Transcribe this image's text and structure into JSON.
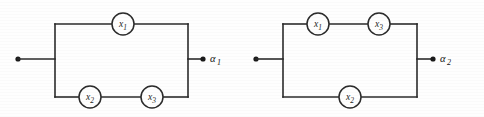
{
  "figure": {
    "background_color": "#fefefe",
    "line_color": "#2b2b2b",
    "width": 484,
    "height": 117
  },
  "circuits": [
    {
      "id": "circuit-1",
      "output_label": "α",
      "output_subscript": "1",
      "input_terminal": {
        "x": 18,
        "y": 59
      },
      "output_terminal": {
        "x": 203,
        "y": 59
      },
      "left_rail_x": 55,
      "right_rail_x": 188,
      "top_rail_y": 24,
      "bottom_rail_y": 97,
      "center_y": 59,
      "top_branch": [
        {
          "name": "x",
          "subscript": "1",
          "cx": 123,
          "cy": 24,
          "r": 11
        }
      ],
      "bottom_branch": [
        {
          "name": "x",
          "subscript": "2",
          "cx": 90,
          "cy": 97,
          "r": 11
        },
        {
          "name": "x",
          "subscript": "3",
          "cx": 152,
          "cy": 97,
          "r": 11
        }
      ]
    },
    {
      "id": "circuit-2",
      "output_label": "α",
      "output_subscript": "2",
      "input_terminal": {
        "x": 256,
        "y": 59
      },
      "output_terminal": {
        "x": 433,
        "y": 59
      },
      "left_rail_x": 283,
      "right_rail_x": 417,
      "top_rail_y": 24,
      "bottom_rail_y": 97,
      "center_y": 59,
      "top_branch": [
        {
          "name": "x",
          "subscript": "1",
          "cx": 318,
          "cy": 24,
          "r": 11
        },
        {
          "name": "x",
          "subscript": "3",
          "cx": 379,
          "cy": 24,
          "r": 11
        }
      ],
      "bottom_branch": [
        {
          "name": "x",
          "subscript": "2",
          "cx": 350,
          "cy": 97,
          "r": 11
        }
      ]
    }
  ],
  "labels": {
    "x1": "x",
    "x2": "x",
    "x3": "x",
    "alpha": "α",
    "sub1": "1",
    "sub2": "2",
    "sub3": "3"
  }
}
